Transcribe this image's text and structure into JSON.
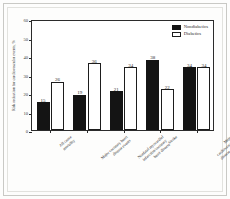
{
  "chart_data": {
    "type": "bar",
    "title": "",
    "xlabel": "",
    "ylabel": "Risk reduction for cardiovascular events, %",
    "ylim": [
      0,
      60
    ],
    "yticks": [
      0,
      10,
      20,
      30,
      40,
      50,
      60
    ],
    "grid": false,
    "legend_position": "top-right-inside",
    "categories": [
      "All cause\nmortality",
      "Major coronary heart\ndisease events",
      "Nonfatal myocardial\ninfarction/coronary\nheart disease",
      "Stroke",
      "Major cardiovascular\ndisease events"
    ],
    "series": [
      {
        "name": "Nondiabetics",
        "values": [
          15,
          19,
          21,
          38,
          34
        ],
        "color": "#141414",
        "style": "filled"
      },
      {
        "name": "Diabetics",
        "values": [
          26,
          36,
          34,
          22,
          34
        ],
        "color": "#ffffff",
        "style": "hollow"
      }
    ]
  },
  "axis": {
    "y_tick_labels": [
      "0",
      "10",
      "20",
      "30",
      "40",
      "50",
      "60"
    ],
    "y_title": "Risk reduction for cardiovascular events, %"
  },
  "legend": {
    "entries": [
      {
        "label": "Nondiabetics"
      },
      {
        "label": "Diabetics"
      }
    ]
  }
}
